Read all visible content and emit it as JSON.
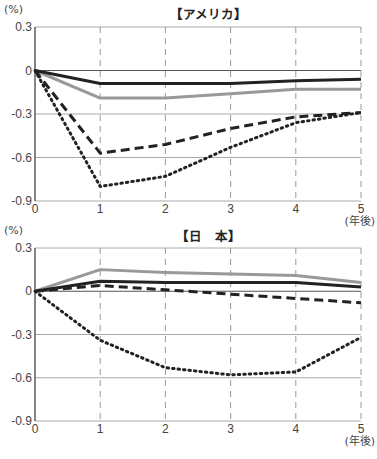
{
  "figure": {
    "top_caption": "(cut-off figure title)",
    "panels": [
      {
        "title": "【アメリカ】",
        "unit": "(%)",
        "x_unit": "(年後)"
      },
      {
        "title": "【日　本】",
        "unit": "(%)",
        "x_unit": "(年後)"
      }
    ]
  },
  "chart_data": [
    {
      "type": "line",
      "title": "【アメリカ】",
      "xlabel": "(年後)",
      "ylabel": "(%)",
      "x": [
        0,
        1,
        2,
        3,
        4,
        5
      ],
      "xticks": [
        "0",
        "1",
        "2",
        "3",
        "4",
        "5"
      ],
      "yticks": [
        "0.3",
        "0",
        "-0.3",
        "-0.6",
        "-0.9"
      ],
      "ylim": [
        -0.9,
        0.3
      ],
      "grid": {
        "horizontal": "solid",
        "vertical": "dashed"
      },
      "series": [
        {
          "name": "black-solid",
          "style": "solid",
          "color": "#222222",
          "values": [
            0,
            -0.09,
            -0.09,
            -0.09,
            -0.07,
            -0.06
          ]
        },
        {
          "name": "gray-solid",
          "style": "solid",
          "color": "#999999",
          "values": [
            0,
            -0.19,
            -0.19,
            -0.16,
            -0.13,
            -0.13
          ]
        },
        {
          "name": "dashed",
          "style": "dashed",
          "color": "#222222",
          "values": [
            0,
            -0.57,
            -0.51,
            -0.4,
            -0.32,
            -0.29
          ]
        },
        {
          "name": "dotted",
          "style": "dotted",
          "color": "#222222",
          "values": [
            0,
            -0.8,
            -0.73,
            -0.53,
            -0.36,
            -0.29
          ]
        }
      ]
    },
    {
      "type": "line",
      "title": "【日　本】",
      "xlabel": "(年後)",
      "ylabel": "(%)",
      "x": [
        0,
        1,
        2,
        3,
        4,
        5
      ],
      "xticks": [
        "0",
        "1",
        "2",
        "3",
        "4",
        "5"
      ],
      "yticks": [
        "0.3",
        "0",
        "-0.3",
        "-0.6",
        "-0.9"
      ],
      "ylim": [
        -0.9,
        0.3
      ],
      "grid": {
        "horizontal": "solid",
        "vertical": "dashed"
      },
      "series": [
        {
          "name": "black-solid",
          "style": "solid",
          "color": "#222222",
          "values": [
            0,
            0.07,
            0.06,
            0.06,
            0.06,
            0.03
          ]
        },
        {
          "name": "gray-solid",
          "style": "solid",
          "color": "#999999",
          "values": [
            0,
            0.15,
            0.13,
            0.12,
            0.11,
            0.06
          ]
        },
        {
          "name": "dashed",
          "style": "dashed",
          "color": "#222222",
          "values": [
            0,
            0.04,
            0.01,
            -0.02,
            -0.05,
            -0.08
          ]
        },
        {
          "name": "dotted",
          "style": "dotted",
          "color": "#222222",
          "values": [
            0,
            -0.34,
            -0.53,
            -0.58,
            -0.56,
            -0.32
          ]
        }
      ]
    }
  ]
}
